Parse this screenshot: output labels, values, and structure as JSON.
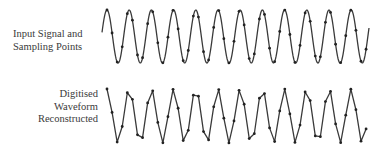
{
  "labels": {
    "top": [
      "Input Signal and",
      "Sampling Points"
    ],
    "bottom": [
      "Digitised",
      "Waveform",
      "Reconstructed"
    ]
  },
  "waves": {
    "x_start": 102,
    "x_end": 369,
    "period": 22.2,
    "first_peak_x": 107,
    "top": {
      "peak_y": 10,
      "trough_y": 63
    },
    "bottom": {
      "peak_y": 89,
      "trough_y": 143
    },
    "sample_start_x": 107,
    "sample_interval": 5.08,
    "stroke_color": "#3a3a3a",
    "dot_color": "#222222"
  }
}
